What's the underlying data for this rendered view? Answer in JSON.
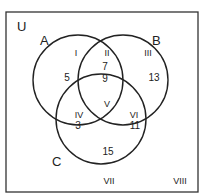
{
  "universe": {
    "label": "U"
  },
  "sets": [
    {
      "name": "A",
      "cx": 78,
      "cy": 80,
      "r": 45,
      "label_x": 44,
      "label_y": 45
    },
    {
      "name": "B",
      "cx": 123,
      "cy": 80,
      "r": 45,
      "label_x": 157,
      "label_y": 45
    },
    {
      "name": "C",
      "cx": 101,
      "cy": 119,
      "r": 45,
      "label_x": 52,
      "label_y": 166
    }
  ],
  "regions": [
    {
      "id": "I",
      "value": "5",
      "roman_x": 76,
      "roman_y": 57,
      "value_x": 66,
      "value_y": 80
    },
    {
      "id": "II",
      "value": "7",
      "value2": "9",
      "roman_x": 105,
      "roman_y": 56,
      "value_x": 105,
      "value_y": 70
    },
    {
      "id": "III",
      "value": "13",
      "roman_x": 147,
      "roman_y": 57,
      "value_x": 154,
      "value_y": 80
    },
    {
      "id": "IV",
      "value": "3",
      "roman_x": 78,
      "roman_y": 117,
      "value_x": 78,
      "value_y": 130
    },
    {
      "id": "V",
      "value": "",
      "roman_x": 105,
      "roman_y": 106
    },
    {
      "id": "VI",
      "value": "11",
      "roman_x": 133,
      "roman_y": 117,
      "value_x": 133,
      "value_y": 130
    },
    {
      "id": "VII",
      "value": "15",
      "roman_x": 105,
      "roman_y": 183,
      "value_x": 108,
      "value_y": 155
    },
    {
      "id": "VIII",
      "value": "",
      "roman_x": 178,
      "roman_y": 183
    }
  ],
  "region_values_text": {
    "I": "5",
    "II_top": "7",
    "II_bottom": "9",
    "III": "13",
    "IV": "3",
    "VI": "11",
    "VII": "15"
  },
  "region_labels": {
    "I": "I",
    "II": "II",
    "III": "III",
    "IV": "IV",
    "V": "V",
    "VI": "VI",
    "VII": "VII",
    "VIII": "VIII"
  },
  "set_labels": {
    "A": "A",
    "B": "B",
    "C": "C"
  }
}
